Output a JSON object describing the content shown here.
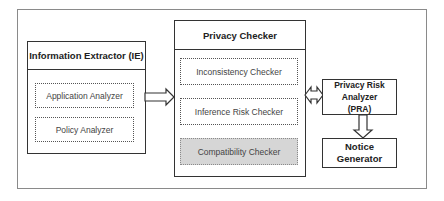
{
  "diagram": {
    "information_extractor": {
      "title": "Information Extractor (IE)",
      "components": [
        "Application Analyzer",
        "Policy Analyzer"
      ]
    },
    "privacy_checker": {
      "title": "Privacy Checker",
      "components": [
        "Inconsistency Checker",
        "Inference Risk Checker",
        "Compatibility Checker"
      ]
    },
    "privacy_risk_analyzer": {
      "title_line1": "Privacy Risk Analyzer",
      "title_line2": "(PRA)"
    },
    "notice_generator": {
      "title": "Notice Generator"
    },
    "connections": [
      {
        "from": "Information Extractor (IE)",
        "to": "Privacy Checker",
        "type": "hollow-arrow"
      },
      {
        "from": "Privacy Checker",
        "to": "Privacy Risk Analyzer (PRA)",
        "type": "hollow-double-arrow"
      },
      {
        "from": "Privacy Risk Analyzer (PRA)",
        "to": "Notice Generator",
        "type": "hollow-arrow"
      }
    ],
    "colors": {
      "border": "#333333",
      "outer_border": "#8a8a8a",
      "highlight_fill": "#d6d6d6"
    }
  }
}
